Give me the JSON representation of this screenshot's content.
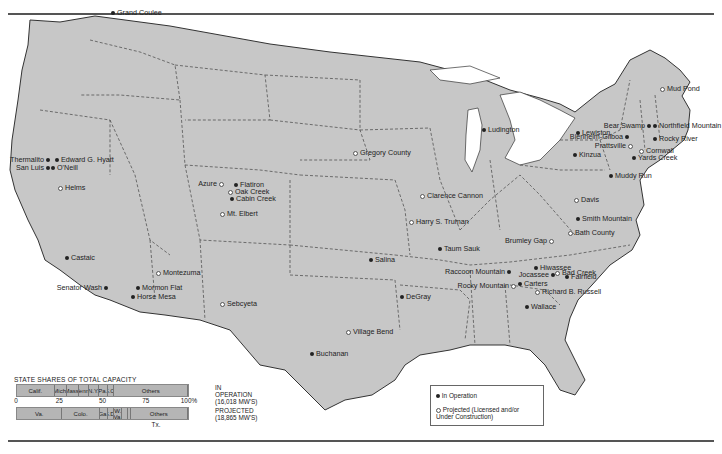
{
  "colors": {
    "land": "#c7c7c7",
    "water": "#ffffff",
    "border": "#444444",
    "operating": "#222222",
    "projected": "#ffffff"
  },
  "sites": [
    {
      "name": "Grand Coulee",
      "status": "operating",
      "x": 113,
      "y": 13,
      "side": "right"
    },
    {
      "name": "Thermalito",
      "status": "operating",
      "x": 47,
      "y": 160,
      "side": "left"
    },
    {
      "name": "Edward G. Hyatt",
      "status": "operating",
      "x": 57,
      "y": 160,
      "side": "right"
    },
    {
      "name": "San Luis",
      "status": "operating",
      "x": 47,
      "y": 168,
      "side": "left"
    },
    {
      "name": "O'Neill",
      "status": "operating",
      "x": 53,
      "y": 168,
      "side": "right"
    },
    {
      "name": "Helms",
      "status": "projected",
      "x": 60,
      "y": 188,
      "side": "right"
    },
    {
      "name": "Castaic",
      "status": "operating",
      "x": 67,
      "y": 258,
      "side": "right"
    },
    {
      "name": "Senator Wash",
      "status": "operating",
      "x": 105,
      "y": 288,
      "side": "left"
    },
    {
      "name": "Montezuma",
      "status": "projected",
      "x": 158,
      "y": 273,
      "side": "right"
    },
    {
      "name": "Mormon Flat",
      "status": "operating",
      "x": 138,
      "y": 288,
      "side": "right"
    },
    {
      "name": "Horse Mesa",
      "status": "operating",
      "x": 133,
      "y": 297,
      "side": "right"
    },
    {
      "name": "Azure",
      "status": "projected",
      "x": 221,
      "y": 184,
      "side": "left"
    },
    {
      "name": "Flatiron",
      "status": "operating",
      "x": 236,
      "y": 185,
      "side": "right"
    },
    {
      "name": "Oak Creek",
      "status": "projected",
      "x": 230,
      "y": 192,
      "side": "right"
    },
    {
      "name": "Cabin Creek",
      "status": "operating",
      "x": 232,
      "y": 199,
      "side": "right"
    },
    {
      "name": "Mt. Elbert",
      "status": "projected",
      "x": 222,
      "y": 214,
      "side": "right"
    },
    {
      "name": "Sebcyeta",
      "status": "projected",
      "x": 222,
      "y": 304,
      "side": "right"
    },
    {
      "name": "Gregory County",
      "status": "projected",
      "x": 355,
      "y": 153,
      "side": "right"
    },
    {
      "name": "Clarence Cannon",
      "status": "projected",
      "x": 422,
      "y": 196,
      "side": "right"
    },
    {
      "name": "Harry S. Truman",
      "status": "projected",
      "x": 411,
      "y": 222,
      "side": "right"
    },
    {
      "name": "Taum Sauk",
      "status": "operating",
      "x": 440,
      "y": 249,
      "side": "right"
    },
    {
      "name": "Salina",
      "status": "operating",
      "x": 371,
      "y": 260,
      "side": "right"
    },
    {
      "name": "DeGray",
      "status": "operating",
      "x": 402,
      "y": 297,
      "side": "right"
    },
    {
      "name": "Village Bend",
      "status": "projected",
      "x": 348,
      "y": 332,
      "side": "right"
    },
    {
      "name": "Buchanan",
      "status": "operating",
      "x": 312,
      "y": 354,
      "side": "right"
    },
    {
      "name": "Ludington",
      "status": "operating",
      "x": 484,
      "y": 130,
      "side": "right"
    },
    {
      "name": "Raccoon Mountain",
      "status": "operating",
      "x": 508,
      "y": 272,
      "side": "left"
    },
    {
      "name": "Rocky Mountain",
      "status": "projected",
      "x": 513,
      "y": 286,
      "side": "left"
    },
    {
      "name": "Carters",
      "status": "operating",
      "x": 520,
      "y": 284,
      "side": "right"
    },
    {
      "name": "Richard B. Russell",
      "status": "projected",
      "x": 537,
      "y": 292,
      "side": "right"
    },
    {
      "name": "Wallace",
      "status": "operating",
      "x": 527,
      "y": 307,
      "side": "right"
    },
    {
      "name": "Hiwassee",
      "status": "operating",
      "x": 536,
      "y": 268,
      "side": "right"
    },
    {
      "name": "Jocassee",
      "status": "operating",
      "x": 552,
      "y": 275,
      "side": "left"
    },
    {
      "name": "Bad Creek",
      "status": "projected",
      "x": 557,
      "y": 273,
      "side": "right"
    },
    {
      "name": "Fairfield",
      "status": "operating",
      "x": 567,
      "y": 277,
      "side": "right"
    },
    {
      "name": "Brumley Gap",
      "status": "projected",
      "x": 551,
      "y": 241,
      "side": "left"
    },
    {
      "name": "Bath County",
      "status": "projected",
      "x": 570,
      "y": 233,
      "side": "right"
    },
    {
      "name": "Smith Mountain",
      "status": "operating",
      "x": 578,
      "y": 219,
      "side": "right"
    },
    {
      "name": "Davis",
      "status": "projected",
      "x": 576,
      "y": 200,
      "side": "right"
    },
    {
      "name": "Muddy Run",
      "status": "operating",
      "x": 611,
      "y": 176,
      "side": "right"
    },
    {
      "name": "Lewiston",
      "status": "operating",
      "x": 578,
      "y": 133,
      "side": "right"
    },
    {
      "name": "Blenheim-Gilboa",
      "status": "operating",
      "x": 626,
      "y": 137,
      "side": "left"
    },
    {
      "name": "Prattsville",
      "status": "projected",
      "x": 630,
      "y": 146,
      "side": "left"
    },
    {
      "name": "Kinzua",
      "status": "operating",
      "x": 575,
      "y": 155,
      "side": "right"
    },
    {
      "name": "Cornwall",
      "status": "projected",
      "x": 641,
      "y": 151,
      "side": "right"
    },
    {
      "name": "Yards Creek",
      "status": "operating",
      "x": 634,
      "y": 158,
      "side": "right"
    },
    {
      "name": "Bear Swamp",
      "status": "operating",
      "x": 648,
      "y": 126,
      "side": "left"
    },
    {
      "name": "Northfield Mountain",
      "status": "operating",
      "x": 655,
      "y": 126,
      "side": "right"
    },
    {
      "name": "Rocky River",
      "status": "operating",
      "x": 655,
      "y": 139,
      "side": "right"
    },
    {
      "name": "Mud Pond",
      "status": "projected",
      "x": 662,
      "y": 89,
      "side": "right"
    }
  ],
  "legend": {
    "operating_label": "In Operation",
    "projected_label": "Projected (Licensed and/or Under Construction)"
  },
  "chart_data": {
    "type": "bar",
    "title": "STATE SHARES OF TOTAL CAPACITY",
    "axis_ticks": [
      "0",
      "25",
      "50",
      "75",
      "100%"
    ],
    "xlim": [
      0,
      100
    ],
    "series": [
      {
        "name": "IN OPERATION",
        "total": "(16,018 MW'S)",
        "segments": [
          {
            "label": "Calif.",
            "value": 22
          },
          {
            "label": "Mich.",
            "value": 7.5
          },
          {
            "label": "Mass.",
            "value": 6.5
          },
          {
            "label": "Tenn.",
            "value": 6
          },
          {
            "label": "N.Y.",
            "value": 6
          },
          {
            "label": "Pa.",
            "value": 5
          },
          {
            "label": "S.C.",
            "value": 4
          },
          {
            "label": "Others",
            "value": 43
          }
        ]
      },
      {
        "name": "PROJECTED",
        "total": "(18,865 MW'S)",
        "segments": [
          {
            "label": "Va.",
            "value": 26.5
          },
          {
            "label": "Colo.",
            "value": 22
          },
          {
            "label": "Ga.",
            "value": 4.5
          },
          {
            "label": "S.D.",
            "value": 4
          },
          {
            "label": "W. Va.",
            "value": 4.5
          },
          {
            "label": "S.C.",
            "value": 3.5
          },
          {
            "label": "Tx.",
            "value": 1.5
          },
          {
            "label": "Others",
            "value": 33.5
          }
        ]
      }
    ],
    "annotation": "Tx."
  }
}
